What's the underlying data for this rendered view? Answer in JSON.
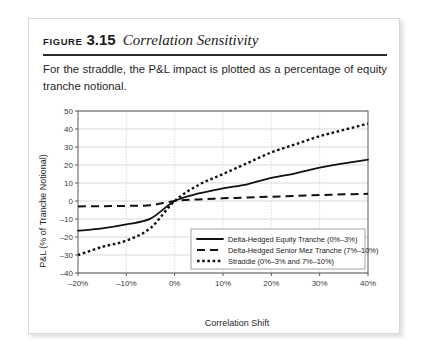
{
  "figure": {
    "label": "FIGURE",
    "number": "3.15",
    "title": "Correlation Sensitivity",
    "description": "For the straddle, the P&L impact is plotted as a percentage of equity tranche notional."
  },
  "chart_data": {
    "type": "line",
    "title": "",
    "xlabel": "Correlation Shift",
    "ylabel": "P&L (% of Tranche Notional)",
    "x": [
      -20,
      -15,
      -10,
      -5,
      0,
      5,
      10,
      15,
      20,
      25,
      30,
      35,
      40
    ],
    "xtick_labels": [
      "–20%",
      "–10%",
      "0%",
      "10%",
      "20%",
      "30%",
      "40%"
    ],
    "xtick_values": [
      -20,
      -10,
      0,
      10,
      20,
      30,
      40
    ],
    "ytick_labels": [
      "50",
      "40",
      "30",
      "20",
      "10",
      "0",
      "–10",
      "–20",
      "–30",
      "–40"
    ],
    "ytick_values": [
      50,
      40,
      30,
      20,
      10,
      0,
      -10,
      -20,
      -30,
      -40
    ],
    "xlim": [
      -20,
      40
    ],
    "ylim": [
      -40,
      50
    ],
    "grid": true,
    "legend_position": "lower right",
    "series": [
      {
        "name": "Delta-Hedged Equity Tranche (0%–3%)",
        "style": "solid",
        "color": "#111111",
        "values": [
          -16.5,
          -15.2,
          -13.0,
          -9.8,
          0.0,
          4.2,
          7.0,
          9.3,
          12.8,
          15.4,
          18.5,
          20.9,
          23.0
        ]
      },
      {
        "name": "Delta-Hedged Senior Mez Tranche (7%–10%)",
        "style": "dashed",
        "color": "#111111",
        "values": [
          -3.0,
          -2.9,
          -2.7,
          -2.3,
          0.0,
          0.9,
          1.5,
          1.9,
          2.4,
          2.8,
          3.3,
          3.7,
          4.0
        ]
      },
      {
        "name": "Straddle (0%–3% and 7%–10%)",
        "style": "dotted",
        "color": "#111111",
        "values": [
          -30.0,
          -25.5,
          -22.0,
          -15.0,
          0.0,
          9.0,
          15.0,
          21.0,
          27.0,
          31.5,
          36.0,
          39.5,
          43.0
        ]
      }
    ]
  }
}
